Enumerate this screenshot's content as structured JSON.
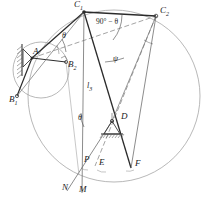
{
  "figure": {
    "type": "kinematic-linkage-geometry-diagram",
    "background": "#ffffff",
    "stroke_dark": "#1a1a1a",
    "stroke_light": "#8a8a8a",
    "width": 209,
    "height": 203
  },
  "points": {
    "A": {
      "label": "A",
      "x": 32,
      "y": 58,
      "lx": 33,
      "ly": 50
    },
    "B1": {
      "label": "B",
      "sub": "1",
      "x": 17,
      "y": 96,
      "lx": 10,
      "ly": 97
    },
    "B2": {
      "label": "B",
      "sub": "2",
      "x": 66,
      "y": 62,
      "lx": 66,
      "ly": 62
    },
    "C1": {
      "label": "C",
      "sub": "1",
      "x": 84,
      "y": 12,
      "lx": 78,
      "ly": 0
    },
    "C2": {
      "label": "C",
      "sub": "2",
      "x": 156,
      "y": 16,
      "lx": 160,
      "ly": 9
    },
    "D": {
      "label": "D",
      "x": 112,
      "y": 121,
      "lx": 120,
      "ly": 113
    },
    "P": {
      "label": "P",
      "x": 80,
      "y": 162,
      "lx": 83,
      "ly": 157
    },
    "E": {
      "label": "E",
      "x": 95,
      "y": 165,
      "lx": 98,
      "ly": 160
    },
    "F": {
      "label": "F",
      "x": 131,
      "y": 167,
      "lx": 134,
      "ly": 161
    },
    "N": {
      "label": "N",
      "x": 67,
      "y": 190,
      "lx": 62,
      "ly": 184
    },
    "M": {
      "label": "M",
      "x": 82,
      "y": 192,
      "lx": 79,
      "ly": 186
    }
  },
  "angles": {
    "theta_at_A": {
      "label": "θ",
      "x": 62,
      "y": 36
    },
    "theta_at_D": {
      "label": "θ",
      "x": 79,
      "y": 118
    },
    "ninety_minus_theta": {
      "label": "90° − θ",
      "x": 97,
      "y": 22
    },
    "psi_at_C1": {
      "label": "ψ",
      "x": 113,
      "y": 58
    }
  },
  "lengths": {
    "l3": {
      "label": "l",
      "sub": "3",
      "x": 88,
      "y": 86
    }
  },
  "circles": {
    "small_B_circle": {
      "cx": 41,
      "cy": 70,
      "r": 28
    },
    "large_C_circle": {
      "cx": 114,
      "cy": 96,
      "r": 86
    }
  },
  "supports": {
    "A_support": {
      "kind": "fixed-pivot-wall-hatched",
      "x": 32,
      "y": 58
    },
    "D_support": {
      "kind": "fixed-pivot-ground-hatched",
      "x": 112,
      "y": 121
    }
  }
}
